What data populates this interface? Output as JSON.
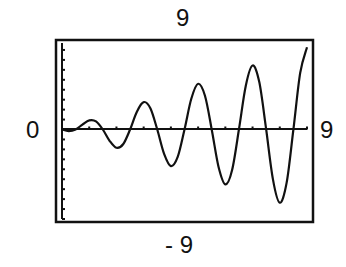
{
  "chart_data": {
    "type": "line",
    "title": "",
    "xlabel": "",
    "ylabel": "",
    "window": {
      "xmin_label": "0",
      "xmax_label": "9",
      "ymax_label": "9",
      "ymin_label": "- 9"
    },
    "xlim": [
      0,
      9
    ],
    "ylim": [
      -9,
      9
    ],
    "xscl": 1,
    "yscl": 1,
    "grid": false,
    "legend": null,
    "series": [
      {
        "name": "oscillating curve with growing amplitude",
        "x": [
          0,
          0.25,
          0.5,
          0.75,
          1,
          1.25,
          1.5,
          1.75,
          2,
          2.25,
          2.5,
          2.75,
          3,
          3.25,
          3.5,
          3.75,
          4,
          4.25,
          4.5,
          4.75,
          5,
          5.25,
          5.5,
          5.75,
          6,
          6.25,
          6.5,
          6.75,
          7,
          7.25,
          7.5,
          7.75,
          8,
          8.25,
          8.5,
          8.75,
          9
        ],
        "y": [
          0,
          -0.16,
          0,
          0.49,
          0.92,
          0.81,
          0,
          -1.14,
          -1.84,
          -1.46,
          0,
          1.79,
          2.76,
          2.11,
          0,
          -2.44,
          -3.68,
          -2.76,
          0,
          3.09,
          4.6,
          3.42,
          0,
          -3.74,
          -5.52,
          -4.07,
          0,
          4.39,
          6.44,
          4.72,
          0,
          -5.04,
          -7.36,
          -5.37,
          0,
          5.69,
          8.28
        ]
      }
    ]
  },
  "labels": {
    "ymax": "9",
    "ymin": "- 9",
    "xmin": "0",
    "xmax": "9"
  },
  "colors": {
    "ink": "#111111",
    "background": "#ffffff"
  }
}
